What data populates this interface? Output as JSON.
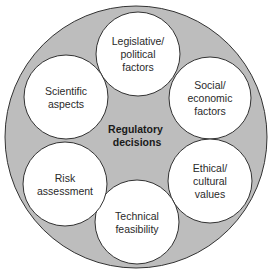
{
  "diagram": {
    "center": {
      "lines": [
        "Regulatory",
        "decisions"
      ],
      "x": 137,
      "y": 133
    },
    "outer_circle": {
      "cx": 136,
      "cy": 137,
      "r": 131
    },
    "colors": {
      "outer_fill": "#bdbdbd",
      "node_fill": "#ffffff",
      "stroke": "#333333",
      "text": "#2a2a2a"
    },
    "nodes": [
      {
        "id": "legislative",
        "cx": 138,
        "cy": 54,
        "r": 42,
        "lines": [
          "Legislative/",
          "political",
          "factors"
        ]
      },
      {
        "id": "social",
        "cx": 210,
        "cy": 98,
        "r": 41,
        "lines": [
          "Social/",
          "economic",
          "factors"
        ]
      },
      {
        "id": "ethical",
        "cx": 210,
        "cy": 181,
        "r": 42,
        "lines": [
          "Ethical/",
          "cultural",
          "values"
        ]
      },
      {
        "id": "technical",
        "cx": 137,
        "cy": 222,
        "r": 42,
        "lines": [
          "Technical",
          "feasibility"
        ]
      },
      {
        "id": "risk",
        "cx": 65,
        "cy": 184,
        "r": 42,
        "lines": [
          "Risk",
          "assessment"
        ]
      },
      {
        "id": "scientific",
        "cx": 66,
        "cy": 97,
        "r": 42,
        "lines": [
          "Scientific",
          "aspects"
        ]
      }
    ]
  }
}
